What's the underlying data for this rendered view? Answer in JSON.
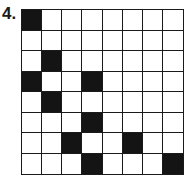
{
  "label": "4.",
  "grid": {
    "rows": 8,
    "cols": 8,
    "filled_color": "#141414",
    "empty_color": "#ffffff",
    "filled": [
      [
        0,
        0
      ],
      [
        2,
        1
      ],
      [
        3,
        0
      ],
      [
        3,
        3
      ],
      [
        4,
        1
      ],
      [
        5,
        3
      ],
      [
        6,
        2
      ],
      [
        6,
        5
      ],
      [
        7,
        3
      ],
      [
        7,
        7
      ]
    ]
  }
}
